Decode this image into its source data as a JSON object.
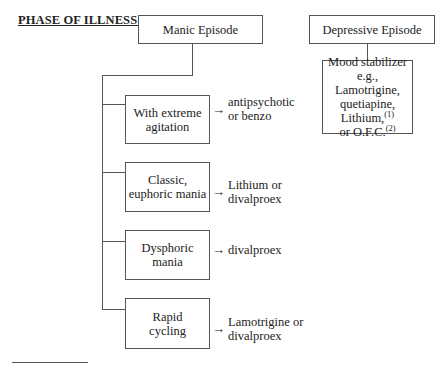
{
  "title": "PHASE OF ILLNESS:",
  "manic": {
    "label": "Manic Episode",
    "subtypes": [
      {
        "line1": "With extreme",
        "line2": "agitation",
        "arrow": "→",
        "treat1": "antipsychotic",
        "treat2": "or benzo"
      },
      {
        "line1": "Classic,",
        "line2": "euphoric mania",
        "arrow": "→",
        "treat1": "Lithium or",
        "treat2": "divalproex"
      },
      {
        "line1": "Dysphoric",
        "line2": "mania",
        "arrow": "→",
        "treat1": "divalproex",
        "treat2": ""
      },
      {
        "line1": "Rapid",
        "line2": "cycling",
        "arrow": "→",
        "treat1": "Lamotrigine or",
        "treat2": "divalproex"
      }
    ]
  },
  "depressive": {
    "label": "Depressive Episode",
    "treatment": {
      "line1": "Mood stabilizer",
      "line2": "e.g., Lamotrigine,",
      "line3": "quetiapine,",
      "line4": "Lithium,",
      "sup1": "(1)",
      "line5": "or O.F.C.",
      "sup2": "(2)"
    }
  },
  "colors": {
    "line": "#555555",
    "text": "#222222"
  }
}
